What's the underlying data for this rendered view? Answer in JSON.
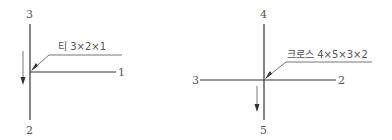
{
  "diagrams": [
    {
      "name": "tee",
      "caption": "티 3×2×1",
      "labels": {
        "top": "3",
        "bottom": "2",
        "right": "1"
      }
    },
    {
      "name": "cross",
      "caption": "크로스 4×5×3×2",
      "labels": {
        "top": "4",
        "bottom": "5",
        "left": "3",
        "right": "2"
      }
    }
  ],
  "colors": {
    "line": "#333333",
    "text": "#555555"
  }
}
